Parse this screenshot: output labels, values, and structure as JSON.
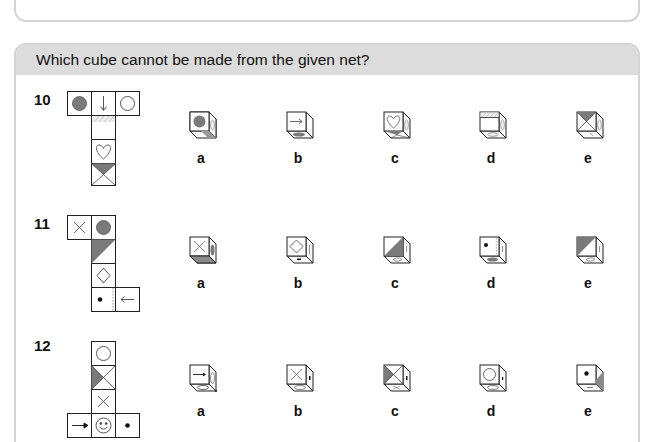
{
  "header": {
    "title": "Which cube cannot be made from the given net?"
  },
  "colors": {
    "shade": "#7a7a7a",
    "hatch": "#bdbdbd",
    "stroke": "#222222",
    "header_bg": "#dcdcdc",
    "border": "#d4d4d4"
  },
  "questions": [
    {
      "number": "10",
      "net_faces": [
        "filled-circle",
        "down-arrow",
        "circle",
        "hatched-strip",
        "heart",
        "x-with-shaded-top-triangle"
      ],
      "options": [
        {
          "label": "a",
          "front": "filled-circle",
          "side": "oval",
          "bottom": "shaded-strip"
        },
        {
          "label": "b",
          "front": "right-arrow",
          "side": "blank",
          "bottom": "filled-oval"
        },
        {
          "label": "c",
          "front": "heart",
          "side": "oval",
          "bottom": "shaded-triangle"
        },
        {
          "label": "d",
          "front": "hatched-top-strip",
          "side": "oval",
          "bottom": "heart"
        },
        {
          "label": "e",
          "front": "x-with-shaded-top-triangle",
          "side": "oval",
          "bottom": "arrow"
        }
      ]
    },
    {
      "number": "11",
      "net_faces": [
        "x",
        "filled-circle",
        "diagonal-shaded-triangle",
        "diamond",
        "dot-with-dotted-edge",
        "left-arrow"
      ],
      "options": [
        {
          "label": "a",
          "front": "x",
          "side": "filled-oval",
          "bottom": "shaded-strip"
        },
        {
          "label": "b",
          "front": "diamond",
          "side": "arrow",
          "bottom": "dot"
        },
        {
          "label": "c",
          "front": "diagonal-shaded-triangle",
          "side": "arrow",
          "bottom": "diamond"
        },
        {
          "label": "d",
          "front": "dot-with-dotted-edge",
          "side": "arrow",
          "bottom": "filled-oval"
        },
        {
          "label": "e",
          "front": "diagonal-shaded-triangle-left",
          "side": "arrow",
          "bottom": "diamond"
        }
      ]
    },
    {
      "number": "12",
      "net_faces": [
        "circle",
        "x-with-shaded-left-triangle",
        "x",
        "right-arrow",
        "smiley",
        "dot"
      ],
      "options": [
        {
          "label": "a",
          "front": "right-arrow",
          "side": "smiley",
          "bottom": "circle"
        },
        {
          "label": "b",
          "front": "x",
          "side": "arrow",
          "bottom": "smiley"
        },
        {
          "label": "c",
          "front": "x-with-shaded-left-triangle",
          "side": "arrow",
          "bottom": "x"
        },
        {
          "label": "d",
          "front": "circle",
          "side": "arrow",
          "bottom": "smiley"
        },
        {
          "label": "e",
          "front": "dot",
          "side": "shaded-triangle",
          "bottom": "arrow"
        }
      ]
    }
  ]
}
